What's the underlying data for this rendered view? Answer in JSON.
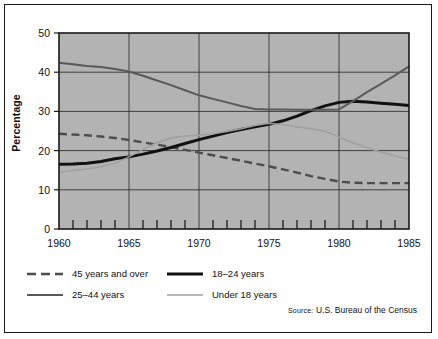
{
  "chart_data": {
    "type": "line",
    "title": "",
    "xlabel": "",
    "ylabel": "Percentage",
    "xlim": [
      1960,
      1985
    ],
    "ylim": [
      0,
      50
    ],
    "xticks": [
      1960,
      1965,
      1970,
      1975,
      1980,
      1985
    ],
    "yticks": [
      0,
      10,
      20,
      30,
      40,
      50
    ],
    "grid": true,
    "minor_xtick_interval": 1,
    "legend_position": "below-left",
    "plot_background": "#b3b3b3",
    "x": [
      1960,
      1961,
      1962,
      1963,
      1964,
      1965,
      1966,
      1967,
      1968,
      1969,
      1970,
      1971,
      1972,
      1973,
      1974,
      1975,
      1976,
      1977,
      1978,
      1979,
      1980,
      1981,
      1982,
      1983,
      1984,
      1985
    ],
    "series": [
      {
        "name": "45 years and over",
        "style": "dashed",
        "color": "#4d4d4d",
        "values": [
          24.3,
          24.1,
          23.9,
          23.6,
          23.2,
          22.7,
          22.1,
          21.5,
          20.9,
          20.2,
          19.5,
          18.8,
          18.1,
          17.4,
          16.7,
          16.0,
          15.2,
          14.4,
          13.5,
          12.8,
          12.1,
          11.8,
          11.7,
          11.7,
          11.7,
          11.7
        ]
      },
      {
        "name": "18–24 years",
        "style": "solid-thick",
        "color": "#111111",
        "values": [
          16.5,
          16.6,
          16.8,
          17.2,
          17.9,
          18.4,
          19.1,
          19.9,
          20.8,
          21.8,
          22.8,
          23.7,
          24.6,
          25.4,
          26.1,
          26.7,
          27.6,
          28.8,
          30.2,
          31.4,
          32.3,
          32.6,
          32.4,
          32.1,
          31.8,
          31.5
        ]
      },
      {
        "name": "25–44 years",
        "style": "solid-medium",
        "color": "#595959",
        "values": [
          42.4,
          42.0,
          41.6,
          41.3,
          40.8,
          40.2,
          39.1,
          37.9,
          36.7,
          35.4,
          34.1,
          33.2,
          32.3,
          31.4,
          30.6,
          30.5,
          30.5,
          30.4,
          30.4,
          30.4,
          30.5,
          32.6,
          34.9,
          37.0,
          39.2,
          41.5
        ]
      },
      {
        "name": "Under 18 years",
        "style": "solid-thin",
        "color": "#a0a0a0",
        "values": [
          14.5,
          14.9,
          15.3,
          15.9,
          16.8,
          18.4,
          20.3,
          22.0,
          23.2,
          23.7,
          23.9,
          24.3,
          24.9,
          25.6,
          26.4,
          27.0,
          26.6,
          26.1,
          25.6,
          25.0,
          23.4,
          22.0,
          20.8,
          19.6,
          18.6,
          17.8
        ]
      }
    ],
    "legend": [
      {
        "label": "45 years and over",
        "style": "dashed",
        "color": "#4d4d4d"
      },
      {
        "label": "18–24 years",
        "style": "solid-thick",
        "color": "#111111"
      },
      {
        "label": "25–44 years",
        "style": "solid-medium",
        "color": "#595959"
      },
      {
        "label": "Under 18 years",
        "style": "solid-thin",
        "color": "#a0a0a0"
      }
    ],
    "source_prefix": "Source:",
    "source_text": "U.S. Bureau of the Census"
  }
}
